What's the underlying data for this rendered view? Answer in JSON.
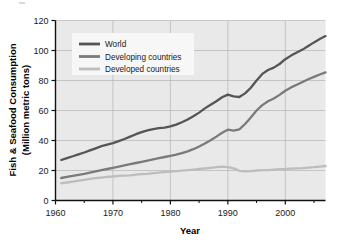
{
  "chart_data": {
    "type": "line",
    "title": "",
    "xlabel": "Year",
    "ylabel": "Fish & Seafood Consumption (Million metric tons)",
    "ylabel_line1": "Fish & Seafood Consumption",
    "ylabel_line2": "(Million metric tons)",
    "xlim": [
      1960,
      2007
    ],
    "ylim": [
      0,
      120
    ],
    "xticks": [
      1960,
      1970,
      1980,
      1990,
      2000
    ],
    "xtick_labels": [
      "1960",
      "1970",
      "1980",
      "1990",
      "2000"
    ],
    "xminor_ticks": [
      1965,
      1975,
      1985,
      1995,
      2005
    ],
    "yticks": [
      0,
      20,
      40,
      60,
      80,
      100,
      120
    ],
    "ytick_labels": [
      "0",
      "20",
      "40",
      "60",
      "80",
      "100",
      "120"
    ],
    "grid": true,
    "grid_color": "#b4b4b4",
    "plot_background": "#e9e9e9",
    "figure_background": "#ffffff",
    "legend": {
      "position": "upper-left-inside",
      "background": "#f7f7f7",
      "entries": [
        {
          "label": "World",
          "color": "#555555"
        },
        {
          "label": "Developing countries",
          "color": "#7a7a7a"
        },
        {
          "label": "Developed countries",
          "color": "#bdbdbd"
        }
      ]
    },
    "x": [
      1961,
      1962,
      1963,
      1964,
      1965,
      1966,
      1967,
      1968,
      1969,
      1970,
      1971,
      1972,
      1973,
      1974,
      1975,
      1976,
      1977,
      1978,
      1979,
      1980,
      1981,
      1982,
      1983,
      1984,
      1985,
      1986,
      1987,
      1988,
      1989,
      1990,
      1991,
      1992,
      1993,
      1994,
      1995,
      1996,
      1997,
      1998,
      1999,
      2000,
      2001,
      2002,
      2003,
      2004,
      2005,
      2006,
      2007
    ],
    "series": [
      {
        "name": "World",
        "color": "#555555",
        "values": [
          27.0,
          28.3,
          29.5,
          30.8,
          32.0,
          33.4,
          34.8,
          36.2,
          37.2,
          38.2,
          39.6,
          41.0,
          42.6,
          44.2,
          45.6,
          46.8,
          47.6,
          48.2,
          48.6,
          49.4,
          50.6,
          52.2,
          54.0,
          56.2,
          58.6,
          61.4,
          63.8,
          66.2,
          68.8,
          70.6,
          69.4,
          69.0,
          71.4,
          75.2,
          80.0,
          84.4,
          87.0,
          88.6,
          91.0,
          94.2,
          96.6,
          98.6,
          100.6,
          103.0,
          105.4,
          107.6,
          109.6
        ]
      },
      {
        "name": "Developing countries",
        "color": "#7a7a7a",
        "values": [
          15.0,
          15.7,
          16.4,
          17.1,
          17.8,
          18.6,
          19.4,
          20.2,
          21.0,
          21.8,
          22.6,
          23.4,
          24.2,
          25.0,
          25.8,
          26.6,
          27.4,
          28.2,
          29.0,
          29.8,
          30.6,
          31.6,
          32.8,
          34.2,
          36.0,
          38.0,
          40.2,
          42.6,
          45.2,
          47.2,
          46.6,
          47.4,
          51.0,
          55.4,
          60.0,
          63.6,
          66.2,
          68.0,
          70.4,
          73.2,
          75.4,
          77.2,
          79.0,
          80.8,
          82.4,
          84.0,
          85.4
        ]
      },
      {
        "name": "Developed countries",
        "color": "#bdbdbd",
        "values": [
          11.5,
          12.0,
          12.6,
          13.2,
          13.8,
          14.4,
          14.9,
          15.3,
          15.7,
          16.0,
          16.4,
          16.6,
          16.8,
          17.2,
          17.6,
          17.8,
          18.2,
          18.6,
          19.0,
          19.3,
          19.6,
          19.9,
          20.2,
          20.6,
          21.0,
          21.4,
          21.8,
          22.2,
          22.6,
          22.2,
          21.4,
          19.8,
          19.4,
          19.6,
          20.0,
          20.2,
          20.3,
          20.6,
          20.9,
          21.0,
          21.2,
          21.4,
          21.6,
          21.9,
          22.2,
          22.6,
          23.0
        ]
      }
    ]
  }
}
